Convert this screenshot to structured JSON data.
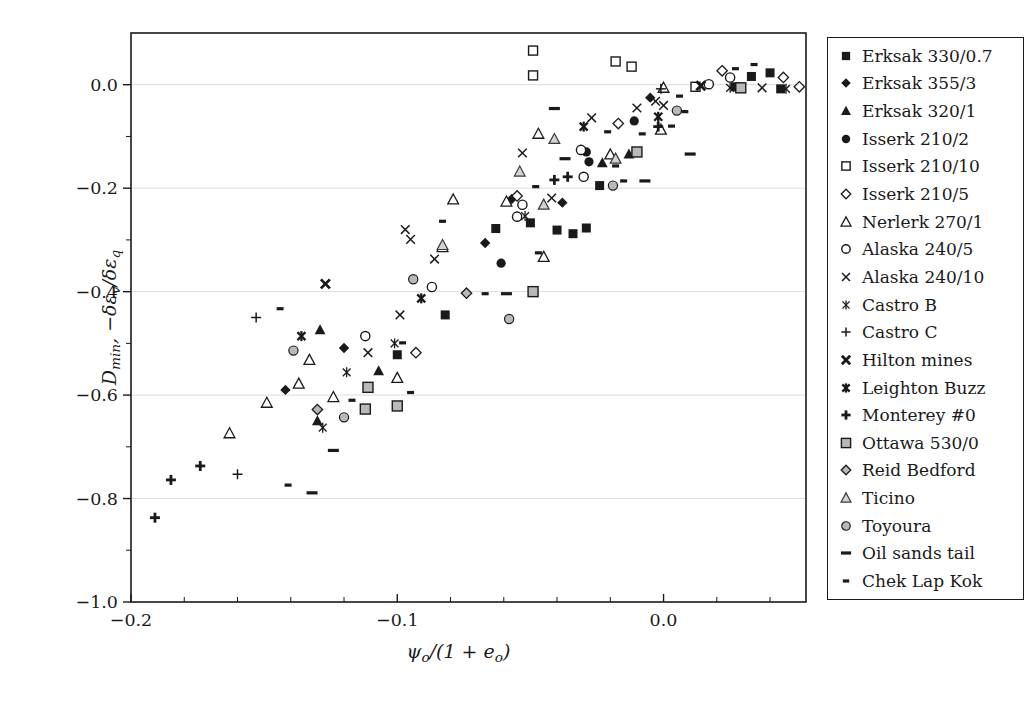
{
  "figure": {
    "background": "#ffffff",
    "ink_color": "#1a1a1a",
    "gray_fill": "#b9b9b9",
    "light_gray_fill": "#d2d2d2",
    "grid_color": "#dcdcdc"
  },
  "chart_data": {
    "type": "scatter",
    "title": "",
    "xlabel": "ψ_{o}/(1 + e_{o})",
    "ylabel": "D_{min}, −δε_{v}/δε_{q}",
    "xlim": [
      -0.2,
      0.0535
    ],
    "ylim": [
      -1.0,
      0.1
    ],
    "x_major_ticks": [
      -0.2,
      -0.1,
      0.0
    ],
    "x_tick_labels": [
      "−0.2",
      "−0.1",
      "0.0"
    ],
    "x_minor_step": 0.02,
    "y_major_ticks": [
      0.0,
      -0.2,
      -0.4,
      -0.6,
      -0.8,
      -1.0
    ],
    "y_tick_labels": [
      "0.0",
      "−0.2",
      "−0.4",
      "−0.6",
      "−0.8",
      "−1.0"
    ],
    "y_minor_step": 0.1,
    "grid": "horizontal-major",
    "legend_position": "right-outside-box",
    "series": [
      {
        "name": "Erksak 330/0.7",
        "marker": "square-filled",
        "points": [
          [
            0.033,
            0.016
          ],
          [
            0.04,
            0.023
          ],
          [
            0.044,
            -0.008
          ],
          [
            0.027,
            -0.004
          ],
          [
            -0.024,
            -0.195
          ],
          [
            -0.05,
            -0.267
          ],
          [
            -0.063,
            -0.278
          ],
          [
            -0.04,
            -0.281
          ],
          [
            -0.034,
            -0.288
          ],
          [
            -0.029,
            -0.277
          ],
          [
            -0.082,
            -0.445
          ],
          [
            -0.1,
            -0.522
          ]
        ]
      },
      {
        "name": "Erksak 355/3",
        "marker": "diamond-filled",
        "points": [
          [
            -0.005,
            -0.025
          ],
          [
            -0.057,
            -0.221
          ],
          [
            -0.038,
            -0.228
          ],
          [
            -0.067,
            -0.306
          ],
          [
            -0.12,
            -0.509
          ],
          [
            -0.142,
            -0.59
          ]
        ]
      },
      {
        "name": "Erksak 320/1",
        "marker": "triangle-filled",
        "points": [
          [
            -0.013,
            -0.134
          ],
          [
            -0.023,
            -0.151
          ],
          [
            -0.129,
            -0.474
          ],
          [
            -0.107,
            -0.553
          ],
          [
            -0.13,
            -0.65
          ]
        ]
      },
      {
        "name": "Isserk 210/2",
        "marker": "circle-filled",
        "points": [
          [
            -0.011,
            -0.07
          ],
          [
            -0.029,
            -0.13
          ],
          [
            -0.028,
            -0.149
          ],
          [
            -0.061,
            -0.345
          ]
        ]
      },
      {
        "name": "Isserk 210/10",
        "marker": "square-open",
        "points": [
          [
            -0.049,
            0.066
          ],
          [
            -0.049,
            0.018
          ],
          [
            -0.018,
            0.045
          ],
          [
            -0.012,
            0.035
          ],
          [
            0.012,
            -0.004
          ]
        ]
      },
      {
        "name": "Isserk 210/5",
        "marker": "diamond-open",
        "points": [
          [
            0.022,
            0.027
          ],
          [
            0.045,
            0.014
          ],
          [
            -0.017,
            -0.075
          ],
          [
            -0.055,
            -0.215
          ],
          [
            -0.093,
            -0.518
          ],
          [
            0.051,
            -0.004
          ]
        ]
      },
      {
        "name": "Nerlerk 270/1",
        "marker": "triangle-open",
        "points": [
          [
            0.0,
            -0.006
          ],
          [
            -0.001,
            -0.087
          ],
          [
            -0.02,
            -0.135
          ],
          [
            -0.047,
            -0.095
          ],
          [
            -0.059,
            -0.226
          ],
          [
            -0.079,
            -0.222
          ],
          [
            -0.083,
            -0.314
          ],
          [
            -0.045,
            -0.333
          ],
          [
            -0.133,
            -0.532
          ],
          [
            -0.1,
            -0.567
          ],
          [
            -0.137,
            -0.578
          ],
          [
            -0.149,
            -0.615
          ],
          [
            -0.124,
            -0.604
          ],
          [
            -0.163,
            -0.674
          ]
        ]
      },
      {
        "name": "Alaska 240/5",
        "marker": "circle-open",
        "points": [
          [
            0.017,
            0.001
          ],
          [
            0.025,
            0.014
          ],
          [
            -0.031,
            -0.126
          ],
          [
            -0.03,
            -0.178
          ],
          [
            -0.053,
            -0.232
          ],
          [
            -0.055,
            -0.255
          ],
          [
            -0.087,
            -0.391
          ],
          [
            -0.112,
            -0.486
          ]
        ]
      },
      {
        "name": "Alaska 240/10",
        "marker": "x-cross",
        "points": [
          [
            -0.003,
            -0.032
          ],
          [
            -0.01,
            -0.045
          ],
          [
            0.0,
            -0.04
          ],
          [
            -0.027,
            -0.064
          ],
          [
            -0.053,
            -0.132
          ],
          [
            -0.042,
            -0.219
          ],
          [
            -0.097,
            -0.28
          ],
          [
            -0.095,
            -0.299
          ],
          [
            -0.086,
            -0.337
          ],
          [
            -0.099,
            -0.445
          ],
          [
            -0.111,
            -0.518
          ],
          [
            0.037,
            -0.006
          ]
        ]
      },
      {
        "name": "Castro B",
        "marker": "asterisk-thin",
        "points": [
          [
            -0.052,
            -0.254
          ],
          [
            -0.101,
            -0.5
          ],
          [
            -0.119,
            -0.556
          ],
          [
            -0.128,
            -0.663
          ],
          [
            0.025,
            -0.006
          ],
          [
            0.046,
            -0.008
          ]
        ]
      },
      {
        "name": "Castro C",
        "marker": "plus-thin",
        "points": [
          [
            -0.001,
            -0.008
          ],
          [
            -0.153,
            -0.45
          ],
          [
            -0.16,
            -0.753
          ]
        ]
      },
      {
        "name": "Hilton mines",
        "marker": "x-bold",
        "points": [
          [
            0.014,
            -0.002
          ],
          [
            -0.127,
            -0.385
          ]
        ]
      },
      {
        "name": "Leighton Buzz",
        "marker": "asterisk-bold",
        "points": [
          [
            -0.03,
            -0.081
          ],
          [
            -0.002,
            -0.062
          ],
          [
            -0.091,
            -0.413
          ],
          [
            -0.136,
            -0.486
          ]
        ]
      },
      {
        "name": "Monterey #0",
        "marker": "plus-bold",
        "points": [
          [
            -0.002,
            -0.081
          ],
          [
            -0.036,
            -0.178
          ],
          [
            -0.041,
            -0.184
          ],
          [
            -0.174,
            -0.737
          ],
          [
            -0.185,
            -0.764
          ],
          [
            -0.191,
            -0.837
          ]
        ]
      },
      {
        "name": "Ottawa 530/0",
        "marker": "square-gray",
        "points": [
          [
            -0.01,
            -0.13
          ],
          [
            0.029,
            -0.006
          ],
          [
            -0.049,
            -0.4
          ],
          [
            -0.111,
            -0.585
          ],
          [
            -0.112,
            -0.627
          ],
          [
            -0.1,
            -0.621
          ]
        ]
      },
      {
        "name": "Reid Bedford",
        "marker": "diamond-gray",
        "points": [
          [
            -0.074,
            -0.403
          ],
          [
            -0.13,
            -0.628
          ]
        ]
      },
      {
        "name": "Ticino",
        "marker": "triangle-gray",
        "points": [
          [
            -0.041,
            -0.105
          ],
          [
            -0.018,
            -0.143
          ],
          [
            -0.054,
            -0.168
          ],
          [
            -0.045,
            -0.232
          ],
          [
            -0.083,
            -0.31
          ]
        ]
      },
      {
        "name": "Toyoura",
        "marker": "circle-gray",
        "points": [
          [
            0.005,
            -0.05
          ],
          [
            -0.019,
            -0.195
          ],
          [
            -0.094,
            -0.376
          ],
          [
            -0.058,
            -0.453
          ],
          [
            -0.139,
            -0.514
          ],
          [
            -0.12,
            -0.643
          ]
        ]
      },
      {
        "name": "Oil sands tail",
        "marker": "dash-long",
        "points": [
          [
            -0.041,
            -0.046
          ],
          [
            -0.037,
            -0.143
          ],
          [
            0.01,
            -0.134
          ],
          [
            -0.007,
            -0.186
          ],
          [
            -0.059,
            -0.404
          ],
          [
            -0.124,
            -0.707
          ],
          [
            -0.132,
            -0.789
          ]
        ]
      },
      {
        "name": "Chek Lap Kok",
        "marker": "dash-short",
        "points": [
          [
            0.027,
            0.031
          ],
          [
            0.034,
            0.039
          ],
          [
            0.006,
            -0.022
          ],
          [
            0.008,
            -0.052
          ],
          [
            0.003,
            -0.08
          ],
          [
            -0.021,
            -0.091
          ],
          [
            -0.008,
            -0.095
          ],
          [
            -0.018,
            -0.157
          ],
          [
            -0.015,
            -0.186
          ],
          [
            -0.048,
            -0.197
          ],
          [
            -0.083,
            -0.264
          ],
          [
            -0.047,
            -0.325
          ],
          [
            -0.144,
            -0.433
          ],
          [
            -0.067,
            -0.404
          ],
          [
            -0.098,
            -0.499
          ],
          [
            -0.117,
            -0.61
          ],
          [
            -0.095,
            -0.595
          ],
          [
            -0.141,
            -0.774
          ]
        ]
      }
    ]
  }
}
